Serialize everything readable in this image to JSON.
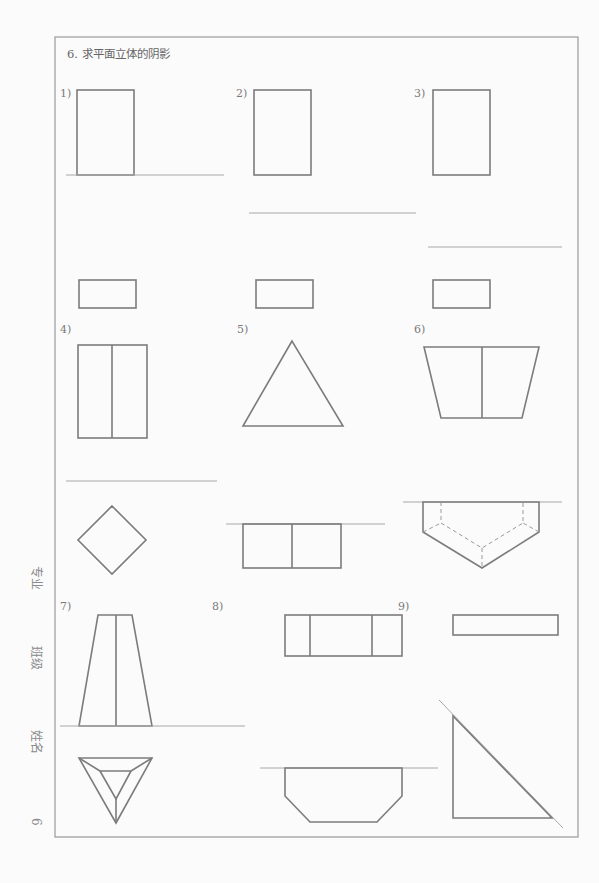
{
  "page": {
    "title": "6. 求平面立体的阴影",
    "side_labels": {
      "major": "专业",
      "class": "班级",
      "name": "姓名",
      "page_number": "6"
    }
  },
  "problems": [
    {
      "label": "1)"
    },
    {
      "label": "2)"
    },
    {
      "label": "3)"
    },
    {
      "label": "4)"
    },
    {
      "label": "5)"
    },
    {
      "label": "6)"
    },
    {
      "label": "7)"
    },
    {
      "label": "8)"
    },
    {
      "label": "9)"
    }
  ],
  "colors": {
    "line": "#7c7c7c",
    "ground_line": "#a8a8a8",
    "frame": "#9a9a9a",
    "background": "#fbfbfb"
  }
}
